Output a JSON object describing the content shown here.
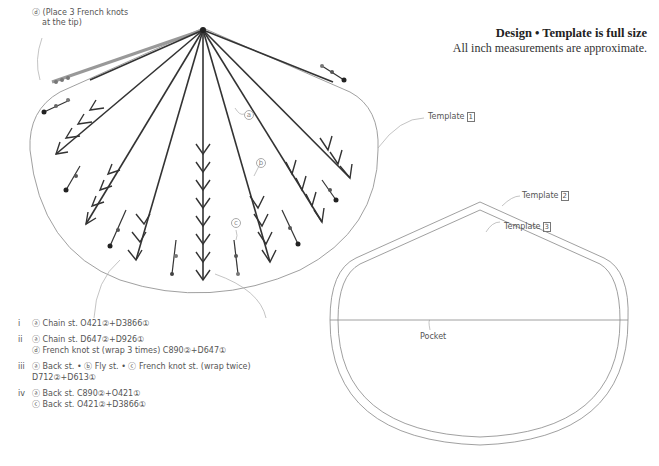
{
  "header": {
    "title": "Design • Template is full size",
    "subtitle": "All inch measurements are approximate."
  },
  "tip_note": {
    "line1": "ⓓ (Place 3 French knots",
    "line2": "at the tip)"
  },
  "templates": {
    "t1": {
      "label": "Template",
      "num": "1"
    },
    "t2": {
      "label": "Template",
      "num": "2"
    },
    "t3": {
      "label": "Template",
      "num": "3"
    },
    "pocket": "Pocket"
  },
  "callouts": {
    "a": "a",
    "b": "b",
    "c": "c"
  },
  "legend": [
    {
      "num": "i",
      "lines": [
        "ⓐ Chain st. O421②+D3866①"
      ]
    },
    {
      "num": "ii",
      "lines": [
        "ⓐ Chain st. D647②+D926①",
        "ⓓ French knot st (wrap 3 times) C890②+D647①"
      ]
    },
    {
      "num": "iii",
      "lines": [
        "ⓐ Back st. • ⓑ Fly st. • ⓒ French knot st. (wrap twice)",
        "D712②+D613①"
      ]
    },
    {
      "num": "iv",
      "lines": [
        "ⓐ Back st. C890②+O421①",
        "ⓒ Back st. O421②+D3866①"
      ]
    }
  ],
  "colors": {
    "outline": "#888888",
    "stitch_dark": "#333333",
    "stitch_grey": "#777777"
  }
}
